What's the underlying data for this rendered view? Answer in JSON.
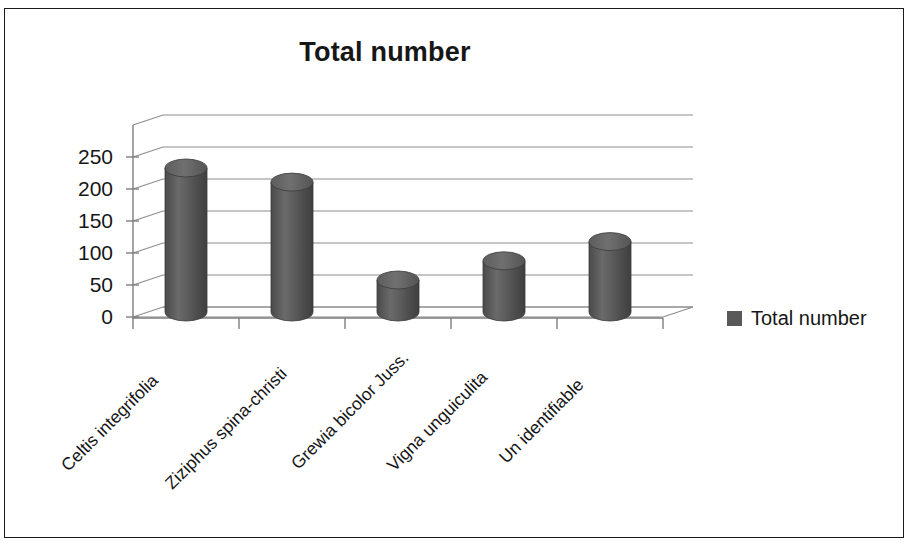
{
  "chart_data": {
    "type": "bar",
    "title": "Total number",
    "xlabel": "",
    "ylabel": "",
    "ylim": [
      0,
      250
    ],
    "yticks": [
      "0",
      "50",
      "100",
      "150",
      "200",
      "250"
    ],
    "grid": true,
    "legend_position": "right",
    "style": "3d-cylinder",
    "bar_color": "#595959",
    "categories": [
      "Celtis integrifolia",
      "Ziziphus spina-christi",
      "Grewia bicolor Juss.",
      "Vigna unguiculita",
      "Un identifiable"
    ],
    "series": [
      {
        "name": "Total number",
        "values": [
          225,
          203,
          50,
          80,
          110
        ]
      }
    ]
  },
  "legend": {
    "entries": [
      {
        "label": "Total number",
        "color": "#595959"
      }
    ]
  }
}
